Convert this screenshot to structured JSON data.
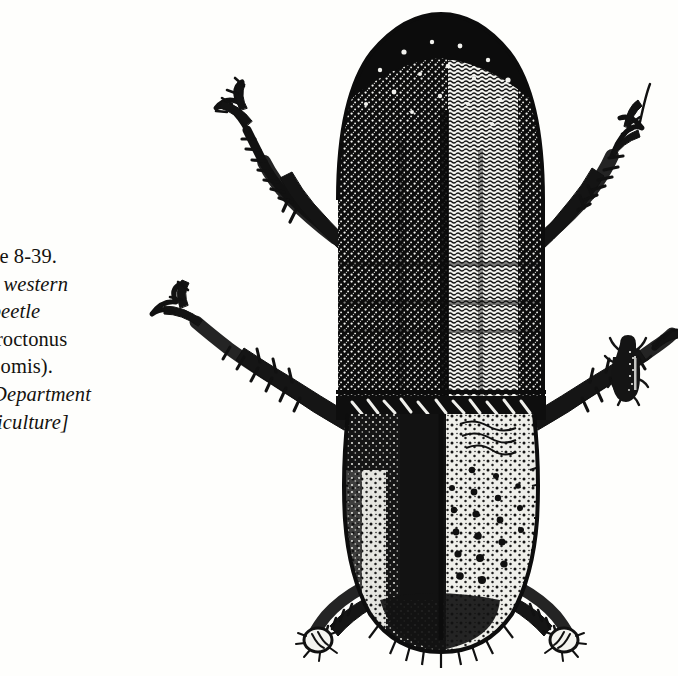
{
  "figure": {
    "number_line": "igure  8-39.",
    "caption_lines": [
      "igure  8-39.",
      "dult western",
      "ne beetle",
      "endroctonus",
      "evicomis).",
      ".S. Department",
      "Agriculture]"
    ],
    "line_styles": [
      "roman",
      "italic",
      "italic",
      "roman",
      "roman",
      "italic",
      "italic"
    ],
    "full_caption": "Figure 8-39. Adult western pine beetle (Dendroctonus brevicomis). [U.S. Department of Agriculture]",
    "credit": "U.S. Department of Agriculture"
  },
  "illustration": {
    "subject": "adult western pine beetle, dorsal view",
    "alt_main": "Pen-and-ink drawing of an adult bark beetle seen from above: rounded stippled pronotum, striate elytra, three pairs of spiny legs",
    "alt_actual_size": "Small silhouette of the same beetle at actual size",
    "technique": "stipple and line engraving",
    "ink_color": "#111111",
    "paper_color": "#fefefc"
  },
  "colors": {
    "ink": "#111111",
    "paper": "#fefefc",
    "text": "#14120f",
    "mid_tone": "#3a3a3a"
  }
}
